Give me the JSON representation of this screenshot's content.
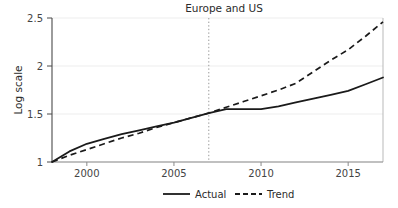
{
  "chart_data": {
    "type": "line",
    "title": "Europe and US",
    "xlabel": "",
    "ylabel": "Log scale",
    "xlim": [
      1998,
      2017
    ],
    "ylim": [
      1,
      2.5
    ],
    "xticks": [
      2000,
      2005,
      2010,
      2015
    ],
    "xtick_labels": [
      "2000",
      "2005",
      "2010",
      "2015"
    ],
    "yticks": [
      1,
      1.5,
      2,
      2.5
    ],
    "ytick_labels": [
      "1",
      "1.5",
      "2",
      "2.5"
    ],
    "grid": "horizontal-faint",
    "legend_position": "below-axis",
    "annotations": [
      {
        "name": "break-line",
        "type": "vertical-dotted-line",
        "x": 2007,
        "label": ""
      }
    ],
    "series": [
      {
        "name": "Actual",
        "style": "solid",
        "color": "#1a1a1a",
        "x": [
          1998,
          1999,
          2000,
          2001,
          2002,
          2003,
          2004,
          2005,
          2006,
          2007,
          2008,
          2009,
          2010,
          2011,
          2012,
          2013,
          2014,
          2015,
          2016,
          2017
        ],
        "values": [
          1.0,
          1.11,
          1.19,
          1.24,
          1.29,
          1.33,
          1.37,
          1.41,
          1.46,
          1.51,
          1.55,
          1.55,
          1.55,
          1.58,
          1.62,
          1.66,
          1.7,
          1.74,
          1.81,
          1.88
        ]
      },
      {
        "name": "Trend",
        "style": "dashed",
        "color": "#1a1a1a",
        "x": [
          1998,
          1999,
          2000,
          2001,
          2002,
          2003,
          2004,
          2005,
          2006,
          2007,
          2008,
          2009,
          2010,
          2011,
          2012,
          2013,
          2014,
          2015,
          2016,
          2017
        ],
        "values": [
          1.0,
          1.07,
          1.13,
          1.19,
          1.25,
          1.3,
          1.36,
          1.41,
          1.46,
          1.51,
          1.57,
          1.63,
          1.69,
          1.75,
          1.82,
          1.94,
          2.06,
          2.17,
          2.31,
          2.46
        ]
      }
    ]
  },
  "legend": {
    "entries": [
      {
        "label": "Actual",
        "style": "solid"
      },
      {
        "label": "Trend",
        "style": "dashed"
      }
    ]
  }
}
